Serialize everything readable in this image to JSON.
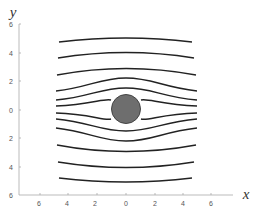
{
  "figure": {
    "x_label": "x",
    "y_label": "y",
    "x_ticks": [
      "6",
      "4",
      "2",
      "0",
      "2",
      "4",
      "6"
    ],
    "y_ticks": [
      "6",
      "4",
      "2",
      "0",
      "2",
      "4",
      "6"
    ],
    "colors": {
      "streamline": "#222222",
      "cylinder_fill": "#6e6e6e",
      "cylinder_stroke": "#444444",
      "axis": "#999999"
    },
    "cylinder": {
      "center_x": 0,
      "center_y": 0,
      "radius": 1
    }
  }
}
